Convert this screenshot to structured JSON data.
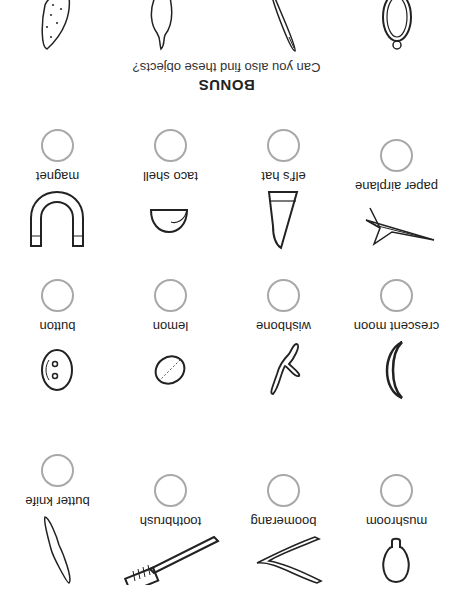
{
  "rows": [
    {
      "items": [
        {
          "name": "mushroom",
          "icon": "mushroom-icon"
        },
        {
          "name": "boomerang",
          "icon": "boomerang-icon"
        },
        {
          "name": "toothbrush",
          "icon": "toothbrush-icon"
        },
        {
          "name": "butter knife",
          "icon": "butter-knife-icon"
        }
      ]
    },
    {
      "items": [
        {
          "name": "crescent moon",
          "icon": "crescent-moon-icon"
        },
        {
          "name": "wishbone",
          "icon": "wishbone-icon"
        },
        {
          "name": "lemon",
          "icon": "lemon-icon"
        },
        {
          "name": "button",
          "icon": "button-icon"
        }
      ]
    },
    {
      "items": [
        {
          "name": "paper airplane",
          "icon": "paper-airplane-icon"
        },
        {
          "name": "elf's hat",
          "icon": "elfs-hat-icon"
        },
        {
          "name": "taco shell",
          "icon": "taco-shell-icon"
        },
        {
          "name": "magnet",
          "icon": "magnet-icon"
        }
      ]
    }
  ],
  "bonus": {
    "title": "BONUS",
    "subtitle": "Can you also find these objects?",
    "objects": [
      "hand-mirror-icon",
      "needle-icon",
      "pear-icon",
      "pickle-icon"
    ]
  },
  "colors": {
    "circle": "#a8a8a8",
    "ink": "#222222",
    "background": "#ffffff"
  },
  "orientation": "rotated 180 degrees"
}
